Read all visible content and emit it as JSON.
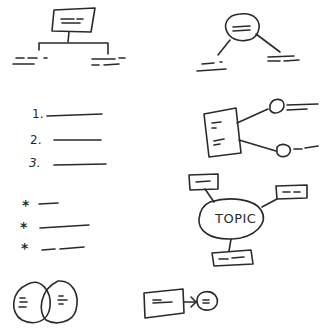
{
  "colors": {
    "ink": "#2a2a2a",
    "background": "#ffffff"
  },
  "diagrams": {
    "hierarchy_tree": {
      "type": "org-chart",
      "root": "box",
      "children": 2
    },
    "circle_branch": {
      "type": "circle-with-two-branches",
      "children": 2
    },
    "numbered_list": {
      "type": "numbered-list",
      "items": [
        "1.",
        "2.",
        "3."
      ]
    },
    "box_spokes": {
      "type": "box-with-two-bubble-spokes",
      "spokes": 2
    },
    "bullet_list": {
      "type": "bullet-list",
      "bullets": [
        "*",
        "*",
        "*"
      ]
    },
    "topic_map": {
      "type": "mind-map",
      "center": "TOPIC",
      "branches": 3
    },
    "venn": {
      "type": "venn-diagram",
      "circles": 2
    },
    "flow": {
      "type": "box-to-circle-flow",
      "nodes": 2
    }
  }
}
